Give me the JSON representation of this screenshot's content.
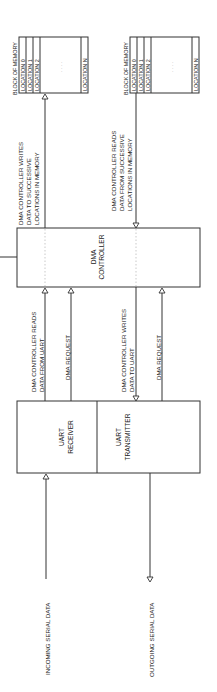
{
  "diagram": {
    "orientation": "rotated-90-ccw",
    "blocks": {
      "dma_controller": {
        "line1": "DMA",
        "line2": "CONTROLLER"
      },
      "uart_receiver": {
        "line1": "UART",
        "line2": "RECEIVER"
      },
      "uart_transmitter": {
        "line1": "UART",
        "line2": "TRANSMITTER"
      }
    },
    "memory_blocks": [
      {
        "title": "BLOCK OF MEMORY",
        "locations": [
          "LOCATION 0",
          "LOCATION 1",
          "LOCATION 2",
          "LOCATION N"
        ],
        "ellipsis": ". . . ."
      },
      {
        "title": "BLOCK OF MEMORY",
        "locations": [
          "LOCATION 0",
          "LOCATION 1",
          "LOCATION 2",
          "LOCATION N"
        ],
        "ellipsis": ". . . ."
      }
    ],
    "connections": {
      "dma_to_memory_write": {
        "lines": [
          "DMA CONTROLLER WRITES",
          "DATA TO SUCCESSIVE",
          "LOCATIONS IN MEMORY"
        ]
      },
      "memory_to_dma_read": {
        "lines": [
          "DMA CONTROLLER READS",
          "DATA FROM SUCCESSIVE",
          "LOCATIONS IN MEMORY"
        ]
      },
      "uart_to_dma_read": {
        "lines": [
          "DMA CONTROLLER READS",
          "DATA FROM UART"
        ]
      },
      "receiver_dma_request": {
        "lines": [
          "DMA REQUEST"
        ]
      },
      "dma_to_uart_write": {
        "lines": [
          "DMA CONTROLLER WRITES",
          "DATA TO UART"
        ]
      },
      "transmitter_dma_request": {
        "lines": [
          "DMA REQUEST"
        ]
      },
      "incoming": {
        "lines": [
          "INCOMING SERIAL DATA"
        ]
      },
      "outgoing": {
        "lines": [
          "OUTGOING SERIAL DATA"
        ]
      }
    }
  }
}
